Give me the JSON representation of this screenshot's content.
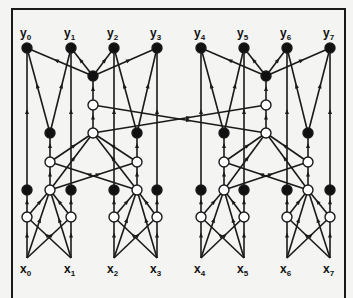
{
  "diagram": {
    "type": "network graph",
    "colors": {
      "line": "#1a1a1a",
      "filled_node": "#111111",
      "hollow_node": "#ffffff",
      "background": "#f4f4f2"
    },
    "outputs": [
      {
        "id": "y0",
        "base": "y",
        "sub": "0"
      },
      {
        "id": "y1",
        "base": "y",
        "sub": "1"
      },
      {
        "id": "y2",
        "base": "y",
        "sub": "2"
      },
      {
        "id": "y3",
        "base": "y",
        "sub": "3"
      },
      {
        "id": "y4",
        "base": "y",
        "sub": "4"
      },
      {
        "id": "y5",
        "base": "y",
        "sub": "5"
      },
      {
        "id": "y6",
        "base": "y",
        "sub": "6"
      },
      {
        "id": "y7",
        "base": "y",
        "sub": "7"
      }
    ],
    "inputs": [
      {
        "id": "x0",
        "base": "x",
        "sub": "0"
      },
      {
        "id": "x1",
        "base": "x",
        "sub": "1"
      },
      {
        "id": "x2",
        "base": "x",
        "sub": "2"
      },
      {
        "id": "x3",
        "base": "x",
        "sub": "3"
      },
      {
        "id": "x4",
        "base": "x",
        "sub": "4"
      },
      {
        "id": "x5",
        "base": "x",
        "sub": "5"
      },
      {
        "id": "x6",
        "base": "x",
        "sub": "6"
      },
      {
        "id": "x7",
        "base": "x",
        "sub": "7"
      }
    ],
    "node_kinds": [
      "filled",
      "hollow"
    ],
    "edge_direction": "upward (inputs x to outputs y)"
  }
}
